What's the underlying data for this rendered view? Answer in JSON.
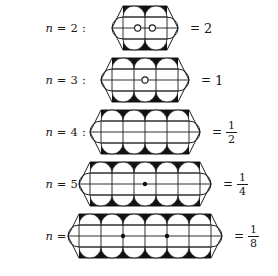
{
  "figure": {
    "ink_color": "#1a1a1a",
    "fill_color": "#111111",
    "background": "#ffffff",
    "rows": [
      {
        "id": "n2",
        "label": "n = 2 :",
        "label_prefix": "n",
        "label_eq": "= 2 :",
        "n": 2,
        "columns": 2,
        "value_text": "2",
        "value_kind": "integer",
        "numerator": "2",
        "denominator": "",
        "eq_sign": "=",
        "center_markers": 2,
        "center_marker_style": "open-circle",
        "top_discs": 2,
        "bottom_discs": 2,
        "left_lens": true,
        "right_lens": true,
        "diagram_width": 70,
        "diagram_height": 44,
        "cell": 22,
        "row_top": 2
      },
      {
        "id": "n3",
        "label": "n = 3 :",
        "label_prefix": "n",
        "label_eq": "= 3 :",
        "n": 3,
        "columns": 3,
        "value_text": "1",
        "value_kind": "integer",
        "numerator": "1",
        "denominator": "",
        "eq_sign": "=",
        "center_markers": 1,
        "center_marker_style": "open-circle",
        "top_discs": 3,
        "bottom_discs": 3,
        "left_lens": true,
        "right_lens": true,
        "diagram_width": 92,
        "diagram_height": 44,
        "cell": 22,
        "row_top": 54
      },
      {
        "id": "n4",
        "label": "n = 4 :",
        "label_prefix": "n",
        "label_eq": "= 4 :",
        "n": 4,
        "columns": 4,
        "value_text": "1/2",
        "value_kind": "fraction",
        "numerator": "1",
        "denominator": "2",
        "eq_sign": "=",
        "center_markers": 0,
        "center_marker_style": "none",
        "top_discs": 4,
        "bottom_discs": 4,
        "left_lens": true,
        "right_lens": true,
        "diagram_width": 114,
        "diagram_height": 44,
        "cell": 22,
        "row_top": 106
      },
      {
        "id": "n5",
        "label": "n = 5 :",
        "label_prefix": "n",
        "label_eq": "= 5 :",
        "n": 5,
        "columns": 5,
        "value_text": "1/4",
        "value_kind": "fraction",
        "numerator": "1",
        "denominator": "4",
        "eq_sign": "=",
        "center_markers": 1,
        "center_marker_style": "filled-dot",
        "top_discs": 5,
        "bottom_discs": 5,
        "left_lens": true,
        "right_lens": true,
        "diagram_width": 136,
        "diagram_height": 44,
        "cell": 22,
        "row_top": 158
      },
      {
        "id": "n6",
        "label": "n = 6 :",
        "label_prefix": "n",
        "label_eq": "= 6 :",
        "n": 6,
        "columns": 6,
        "value_text": "1/8",
        "value_kind": "fraction",
        "numerator": "1",
        "denominator": "8",
        "eq_sign": "=",
        "center_markers": 2,
        "center_marker_style": "filled-dot",
        "top_discs": 6,
        "bottom_discs": 6,
        "left_lens": true,
        "right_lens": true,
        "diagram_width": 158,
        "diagram_height": 44,
        "cell": 22,
        "row_top": 210
      }
    ]
  }
}
